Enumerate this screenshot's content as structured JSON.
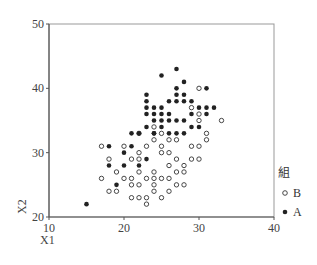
{
  "chart_data": {
    "type": "scatter",
    "title": "",
    "xlabel": "X1",
    "ylabel": "X2",
    "xlim": [
      10,
      40
    ],
    "ylim": [
      20,
      50
    ],
    "xticks": [
      10,
      20,
      30,
      40
    ],
    "yticks": [
      20,
      30,
      40,
      50
    ],
    "grid": false,
    "legend": {
      "title": "組",
      "position": "right",
      "entries": [
        "B",
        "A"
      ]
    },
    "series": [
      {
        "name": "B",
        "marker": "open-circle",
        "points": [
          [
            17,
            31
          ],
          [
            20,
            31
          ],
          [
            22,
            30
          ],
          [
            18,
            29
          ],
          [
            21,
            29
          ],
          [
            22,
            29
          ],
          [
            19,
            27
          ],
          [
            22,
            27
          ],
          [
            17,
            26
          ],
          [
            20,
            26
          ],
          [
            21,
            26
          ],
          [
            23,
            26
          ],
          [
            24,
            26
          ],
          [
            25,
            26
          ],
          [
            26,
            26
          ],
          [
            24,
            27
          ],
          [
            18,
            24
          ],
          [
            19,
            24
          ],
          [
            21,
            25
          ],
          [
            22,
            25
          ],
          [
            24,
            25
          ],
          [
            24,
            24
          ],
          [
            25,
            23
          ],
          [
            21,
            23
          ],
          [
            22,
            23
          ],
          [
            23,
            23
          ],
          [
            23,
            22
          ],
          [
            26,
            24
          ],
          [
            27,
            25
          ],
          [
            28,
            25
          ],
          [
            27,
            27
          ],
          [
            28,
            27
          ],
          [
            26,
            28
          ],
          [
            27,
            29
          ],
          [
            29,
            29
          ],
          [
            30,
            29
          ],
          [
            25,
            30
          ],
          [
            23,
            31
          ],
          [
            24,
            32
          ],
          [
            25,
            31
          ],
          [
            25,
            33
          ],
          [
            26,
            32
          ],
          [
            27,
            32
          ],
          [
            24,
            34
          ],
          [
            30,
            31
          ],
          [
            30,
            35
          ],
          [
            30,
            36
          ],
          [
            30,
            40
          ],
          [
            29,
            37
          ],
          [
            31,
            33
          ],
          [
            31,
            32
          ],
          [
            33,
            35
          ],
          [
            28,
            28
          ],
          [
            26,
            30
          ],
          [
            29,
            31
          ],
          [
            22,
            33
          ]
        ]
      },
      {
        "name": "A",
        "marker": "filled-circle",
        "points": [
          [
            15,
            22
          ],
          [
            19,
            25
          ],
          [
            18,
            31
          ],
          [
            21,
            31
          ],
          [
            20,
            30
          ],
          [
            18,
            28
          ],
          [
            20,
            28
          ],
          [
            22,
            28
          ],
          [
            23,
            29
          ],
          [
            22,
            33
          ],
          [
            24,
            33
          ],
          [
            23,
            34
          ],
          [
            23,
            36
          ],
          [
            23,
            37
          ],
          [
            23,
            38
          ],
          [
            23,
            39
          ],
          [
            24,
            35
          ],
          [
            24,
            36
          ],
          [
            25,
            35
          ],
          [
            25,
            36
          ],
          [
            25,
            37
          ],
          [
            26,
            36
          ],
          [
            24,
            37
          ],
          [
            26,
            35
          ],
          [
            27,
            35
          ],
          [
            28,
            35
          ],
          [
            25,
            34
          ],
          [
            27,
            33
          ],
          [
            28,
            33
          ],
          [
            26,
            33
          ],
          [
            26,
            38
          ],
          [
            27,
            38
          ],
          [
            28,
            38
          ],
          [
            27,
            39
          ],
          [
            28,
            39
          ],
          [
            29,
            38
          ],
          [
            30,
            37
          ],
          [
            31,
            36
          ],
          [
            31,
            37
          ],
          [
            32,
            37
          ],
          [
            31,
            40
          ],
          [
            27,
            40
          ],
          [
            27,
            43
          ],
          [
            25,
            42
          ],
          [
            28,
            41
          ],
          [
            29,
            34
          ],
          [
            29,
            36
          ],
          [
            30,
            34
          ],
          [
            21,
            33
          ],
          [
            24,
            33
          ]
        ]
      }
    ]
  },
  "axes": {
    "x_label": "X1",
    "y_label": "X2",
    "x_ticks": [
      "10",
      "20",
      "30",
      "40"
    ],
    "y_ticks": [
      "20",
      "30",
      "40",
      "50"
    ]
  },
  "legend": {
    "title": "組",
    "items": [
      {
        "label": "B",
        "marker": "open-circle"
      },
      {
        "label": "A",
        "marker": "filled-circle"
      }
    ]
  }
}
